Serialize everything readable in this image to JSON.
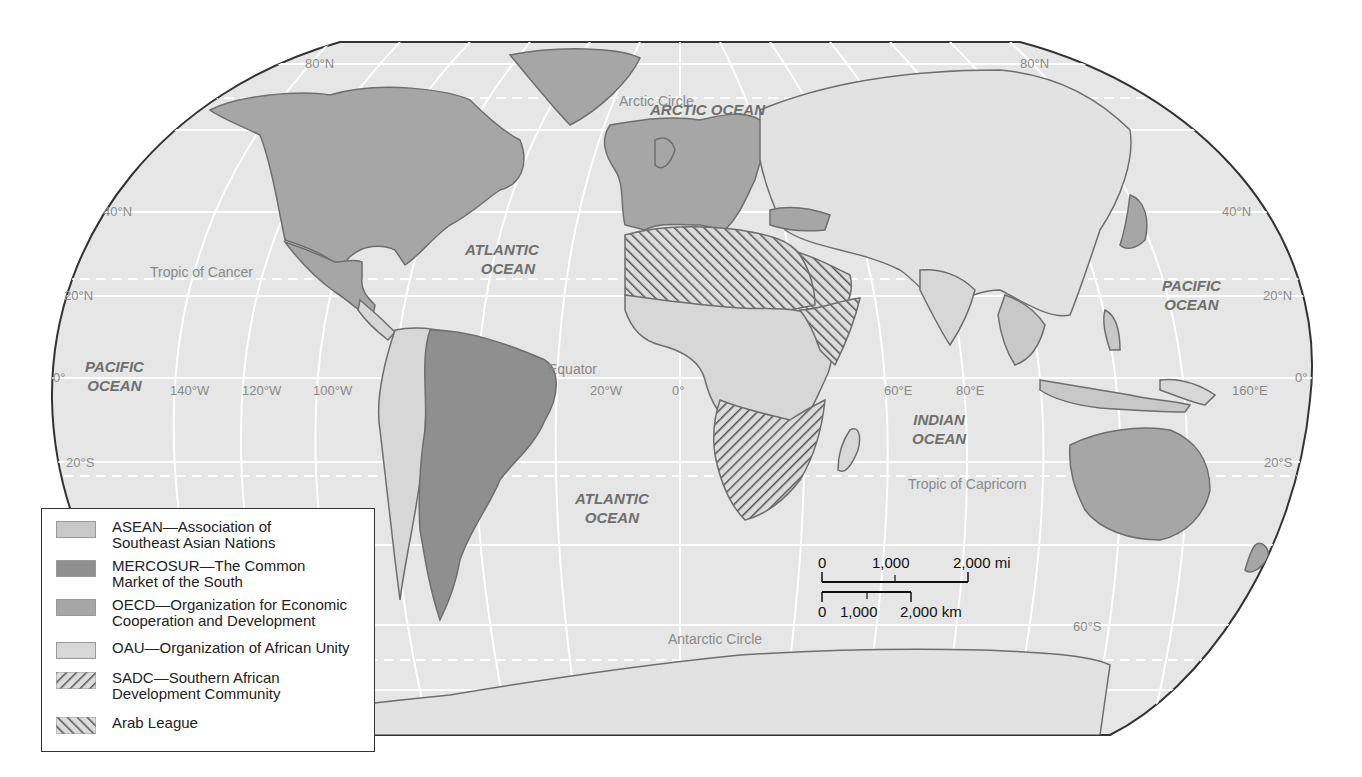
{
  "map": {
    "projection": "Robinson-style world map",
    "colors": {
      "ocean": "#e6e6e6",
      "graticule": "#ffffff",
      "outline": "#333333",
      "asean": "#c8c8c8",
      "mercosur": "#8f8f8f",
      "oecd": "#a6a6a6",
      "oau": "#d7d7d7",
      "nonmember_land": "#e2e2e2",
      "border": "#6e6e6e"
    },
    "oceans": {
      "arctic": "ARCTIC OCEAN",
      "atlantic_north": [
        "ATLANTIC",
        "OCEAN"
      ],
      "atlantic_south": [
        "ATLANTIC",
        "OCEAN"
      ],
      "pacific_west": [
        "PACIFIC",
        "OCEAN"
      ],
      "pacific_east": [
        "PACIFIC",
        "OCEAN"
      ],
      "indian": [
        "INDIAN",
        "OCEAN"
      ]
    },
    "reference_lines": {
      "arctic_circle": "Arctic Circle",
      "tropic_cancer": "Tropic of Cancer",
      "equator": "Equator",
      "tropic_capricorn": "Tropic of Capricorn",
      "antarctic_circle": "Antarctic Circle"
    },
    "latitude_labels": {
      "n80_left": "80°N",
      "n80_right": "80°N",
      "n40_left": "40°N",
      "n40_right": "40°N",
      "n20_left": "20°N",
      "n20_right": "20°N",
      "eq_left": "0°",
      "eq_right": "0°",
      "s20_left": "20°S",
      "s20_right": "20°S",
      "s60_right": "60°S"
    },
    "longitude_labels": [
      "140°W",
      "120°W",
      "100°W",
      "20°W",
      "0°",
      "60°E",
      "80°E",
      "160°E"
    ]
  },
  "legend": {
    "items": [
      {
        "line1": "ASEAN—Association of",
        "line2": "Southeast Asian Nations",
        "swatch": "asean"
      },
      {
        "line1": "MERCOSUR—The Common",
        "line2": "Market of the South",
        "swatch": "mercosur"
      },
      {
        "line1": "OECD—Organization for Economic",
        "line2": "Cooperation and Development",
        "swatch": "oecd"
      },
      {
        "line1": "OAU—Organization of African Unity",
        "line2": "",
        "swatch": "oau"
      },
      {
        "line1": "SADC—Southern African",
        "line2": "Development Community",
        "swatch": "sadc-hatch"
      },
      {
        "line1": "Arab League",
        "line2": "",
        "swatch": "arab-hatch"
      }
    ]
  },
  "scale_bar": {
    "miles": {
      "ticks": [
        "0",
        "1,000",
        "2,000 mi"
      ]
    },
    "km": {
      "ticks": [
        "0",
        "1,000",
        "2,000 km"
      ]
    }
  }
}
